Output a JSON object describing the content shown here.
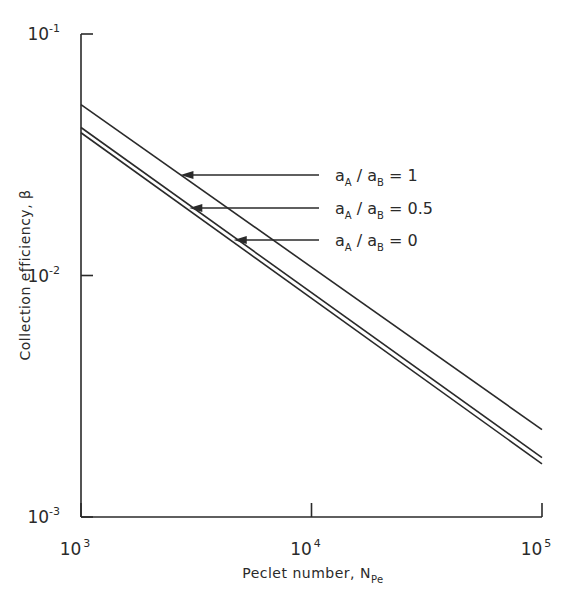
{
  "chart_data": {
    "type": "line",
    "title": "",
    "xlabel": "Peclet number, N",
    "xlabel_subscript": "Pe",
    "ylabel": "Collection efficiency, β",
    "xscale": "log",
    "yscale": "log",
    "xlim": [
      1000,
      100000
    ],
    "ylim": [
      0.001,
      0.1
    ],
    "grid": false,
    "x_ticks": [
      {
        "base": "10",
        "exp": "3",
        "value": 1000
      },
      {
        "base": "10",
        "exp": "4",
        "value": 10000
      },
      {
        "base": "10",
        "exp": "5",
        "value": 100000
      }
    ],
    "y_ticks": [
      {
        "base": "10",
        "exp": "-1",
        "value": 0.1
      },
      {
        "base": "10",
        "exp": "-2",
        "value": 0.01
      },
      {
        "base": "10",
        "exp": "-3",
        "value": 0.001
      }
    ],
    "x": [
      1000,
      100000
    ],
    "series": [
      {
        "name": "aA/aB = 1",
        "label_main": "a",
        "sub1": "A",
        "sep": " / a",
        "sub2": "B",
        "eq": " = 1",
        "values": [
          0.051,
          0.0023
        ],
        "arrow_x": 2700
      },
      {
        "name": "aA/aB = 0.5",
        "label_main": "a",
        "sub1": "A",
        "sep": " / a",
        "sub2": "B",
        "eq": " = 0.5",
        "values": [
          0.041,
          0.00176
        ],
        "arrow_x": 2950
      },
      {
        "name": "aA/aB = 0",
        "label_main": "a",
        "sub1": "A",
        "sep": " / a",
        "sub2": "B",
        "eq": " = 0",
        "values": [
          0.039,
          0.00166
        ],
        "arrow_x": 4600
      }
    ]
  }
}
